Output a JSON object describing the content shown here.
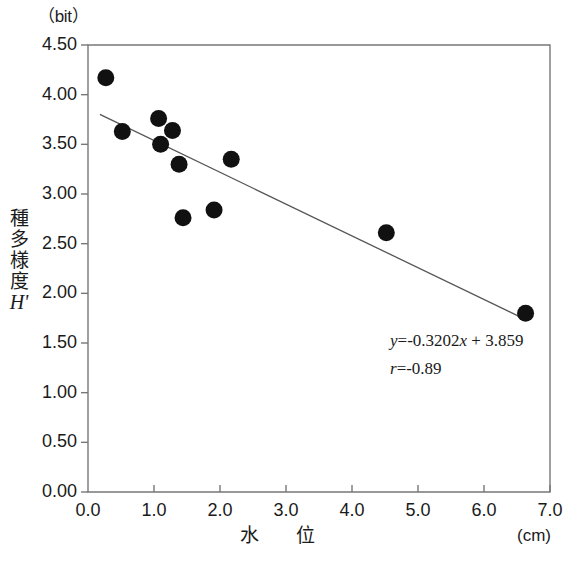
{
  "chart_data": {
    "type": "scatter",
    "title": "",
    "xlabel": "水　位",
    "ylabel": "種多様度",
    "ylabel_symbol": "H'",
    "x_unit": "(cm)",
    "y_unit": "（bit）",
    "xlim": [
      0.0,
      7.0
    ],
    "ylim": [
      0.0,
      4.5
    ],
    "xticks": [
      "0.0",
      "1.0",
      "2.0",
      "3.0",
      "4.0",
      "5.0",
      "6.0",
      "7.0"
    ],
    "xtick_values": [
      0.0,
      1.0,
      2.0,
      3.0,
      4.0,
      5.0,
      6.0,
      7.0
    ],
    "yticks": [
      "0.00",
      "0.50",
      "1.00",
      "1.50",
      "2.00",
      "2.50",
      "3.00",
      "3.50",
      "4.00",
      "4.50"
    ],
    "ytick_values": [
      0.0,
      0.5,
      1.0,
      1.5,
      2.0,
      2.5,
      3.0,
      3.5,
      4.0,
      4.5
    ],
    "grid": false,
    "legend": false,
    "marker_color": "#111111",
    "line_color": "#555555",
    "points": [
      {
        "x": 0.27,
        "y": 4.17
      },
      {
        "x": 0.52,
        "y": 3.63
      },
      {
        "x": 1.07,
        "y": 3.76
      },
      {
        "x": 1.1,
        "y": 3.5
      },
      {
        "x": 1.28,
        "y": 3.64
      },
      {
        "x": 1.38,
        "y": 3.3
      },
      {
        "x": 1.44,
        "y": 2.76
      },
      {
        "x": 1.91,
        "y": 2.84
      },
      {
        "x": 2.17,
        "y": 3.35
      },
      {
        "x": 4.52,
        "y": 2.61
      },
      {
        "x": 6.63,
        "y": 1.8
      }
    ],
    "trendline": {
      "slope": -0.3202,
      "intercept": 3.859,
      "x_start": 0.18,
      "x_end": 6.63
    },
    "annotations": {
      "equation_y": "y",
      "equation_body": "=-0.3202",
      "equation_x": "x",
      "equation_tail": " + 3.859",
      "equation_full": "y=-0.3202x + 3.859",
      "correlation_r": "r",
      "correlation_value": "=-0.89",
      "correlation_full": "r=-0.89"
    }
  }
}
